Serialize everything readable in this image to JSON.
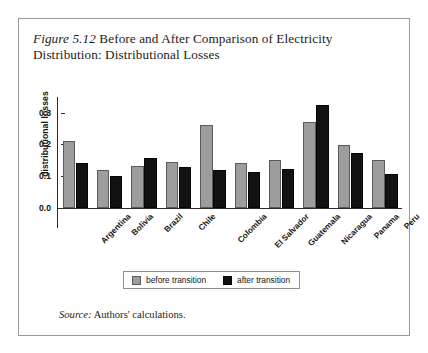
{
  "figure": {
    "number_label": "Figure 5.12",
    "title_text": " Before and After Comparison of Electricity Distribution: Distributional Losses",
    "source_lead": "Source:",
    "source_text": " Authors' calculations."
  },
  "legend": {
    "before_label": "before transition",
    "after_label": "after transition",
    "before_color": "#9d9d9d",
    "after_color": "#121212"
  },
  "axis": {
    "y_label": "distributional losses",
    "y_ticks": [
      "0.3",
      "0.2",
      "0.1",
      "0.0"
    ]
  },
  "chart_data": {
    "type": "bar",
    "title": "Figure 5.12 Before and After Comparison of Electricity Distribution: Distributional Losses",
    "xlabel": "",
    "ylabel": "distributional losses",
    "ylim": [
      0.0,
      0.35
    ],
    "yticks": [
      0.0,
      0.1,
      0.2,
      0.3
    ],
    "grid": false,
    "legend_position": "bottom-center",
    "categories": [
      "Argentina",
      "Bolivia",
      "Brazil",
      "Chile",
      "Colombia",
      "El Salvador",
      "Guatemala",
      "Nicaragua",
      "Panama",
      "Peru"
    ],
    "series": [
      {
        "name": "before transition",
        "color": "#9d9d9d",
        "values": [
          0.211,
          0.118,
          0.131,
          0.143,
          0.262,
          0.142,
          0.15,
          0.272,
          0.199,
          0.152
        ]
      },
      {
        "name": "after transition",
        "color": "#121212",
        "values": [
          0.141,
          0.1,
          0.158,
          0.127,
          0.12,
          0.112,
          0.121,
          0.325,
          0.172,
          0.107
        ]
      }
    ],
    "annotations": [
      "Source: Authors' calculations."
    ]
  }
}
